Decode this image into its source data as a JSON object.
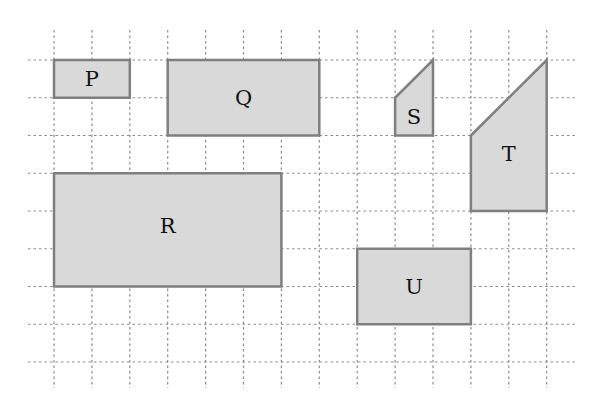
{
  "diagram": {
    "type": "grid-shapes",
    "grid": {
      "origin_px": [
        54,
        60
      ],
      "cell_px": [
        37.9,
        37.75
      ],
      "columns": 14,
      "rows": 9,
      "line_style": "dotted",
      "line_color": "#8a8a8a",
      "h_extent_px": [
        28,
        578
      ],
      "v_extent_px": [
        30,
        388
      ]
    },
    "fill_color": "#d9d9d9",
    "stroke_color": "#7f7f7f",
    "shapes": [
      {
        "id": "P",
        "label": "P",
        "kind": "rectangle",
        "points": [
          [
            0,
            0
          ],
          [
            2,
            0
          ],
          [
            2,
            1
          ],
          [
            0,
            1
          ]
        ],
        "label_at": [
          1,
          0.5
        ]
      },
      {
        "id": "Q",
        "label": "Q",
        "kind": "rectangle",
        "points": [
          [
            3,
            0
          ],
          [
            7,
            0
          ],
          [
            7,
            2
          ],
          [
            3,
            2
          ]
        ],
        "label_at": [
          5,
          1
        ]
      },
      {
        "id": "S",
        "label": "S",
        "kind": "trapezoid",
        "points": [
          [
            9,
            1
          ],
          [
            10,
            0
          ],
          [
            10,
            2
          ],
          [
            9,
            2
          ]
        ],
        "label_at": [
          9.5,
          1.5
        ]
      },
      {
        "id": "T",
        "label": "T",
        "kind": "trapezoid",
        "points": [
          [
            11,
            2
          ],
          [
            13,
            0
          ],
          [
            13,
            4
          ],
          [
            11,
            4
          ]
        ],
        "label_at": [
          12,
          2.5
        ]
      },
      {
        "id": "R",
        "label": "R",
        "kind": "rectangle",
        "points": [
          [
            0,
            3
          ],
          [
            6,
            3
          ],
          [
            6,
            6
          ],
          [
            0,
            6
          ]
        ],
        "label_at": [
          3,
          4.4
        ]
      },
      {
        "id": "U",
        "label": "U",
        "kind": "rectangle",
        "points": [
          [
            8,
            5
          ],
          [
            11,
            5
          ],
          [
            11,
            7
          ],
          [
            8,
            7
          ]
        ],
        "label_at": [
          9.5,
          6
        ]
      }
    ]
  }
}
